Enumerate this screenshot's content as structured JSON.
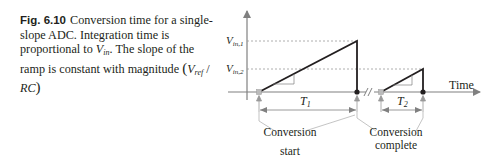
{
  "caption": {
    "figure_number": "Fig. 6.10",
    "text_1": "Conversion time for a single-slope ADC. Integration time is proportional to ",
    "vin_symbol": "V",
    "vin_subscript": "in",
    "text_2": ". The slope of the ramp is constant with magnitude ",
    "formula_open": "(",
    "vref_symbol": "V",
    "vref_subscript": "ref",
    "formula_sep": " / ",
    "rc_symbol": "RC",
    "formula_close": ")"
  },
  "diagram": {
    "y_labels": {
      "vin1": "V",
      "vin1_sub": "in,1",
      "vin2": "V",
      "vin2_sub": "in,2"
    },
    "x_axis_label": "Time",
    "interval_1": "T",
    "interval_1_sub": "1",
    "interval_2": "T",
    "interval_2_sub": "2",
    "label_start_line1": "Conversion",
    "label_start_line2": "start",
    "label_complete_line1": "Conversion",
    "label_complete_line2": "complete",
    "colors": {
      "ramp": "#231f20",
      "axis": "#808080",
      "dashed": "#999999",
      "marker": "#aaaaaa"
    }
  }
}
